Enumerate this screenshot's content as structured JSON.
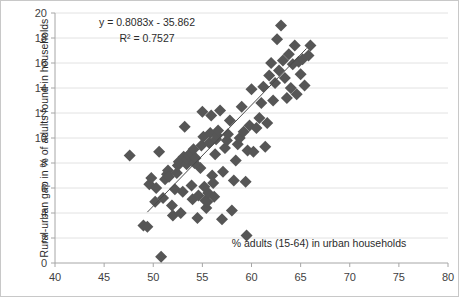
{
  "chart_data": {
    "type": "scatter",
    "title": "",
    "xlabel": "% adults (15-64) in urban households",
    "ylabel": "Rural-urban gap in % of adults found in households",
    "xlim": [
      40,
      80
    ],
    "ylim": [
      0,
      20
    ],
    "xticks": [
      40,
      45,
      50,
      55,
      60,
      65,
      70,
      75,
      80
    ],
    "yticks": [
      0,
      2,
      4,
      6,
      8,
      10,
      12,
      14,
      16,
      18,
      20
    ],
    "grid": "horizontal",
    "legend": "none",
    "annotations": {
      "equation": "y = 0.8083x - 35.862",
      "r_squared": "R² = 0.7527"
    },
    "trendline": {
      "slope": 0.8083,
      "intercept": -35.862,
      "r2": 0.7527,
      "x_start": 49.4,
      "x_end": 65.6
    },
    "marker": {
      "shape": "diamond",
      "color": "#565656",
      "size": 6
    },
    "points": [
      [
        49.0,
        3.0
      ],
      [
        49.4,
        2.9
      ],
      [
        49.6,
        6.3
      ],
      [
        49.8,
        6.8
      ],
      [
        50.2,
        4.9
      ],
      [
        50.3,
        6.0
      ],
      [
        50.6,
        8.9
      ],
      [
        50.8,
        0.5
      ],
      [
        51.0,
        5.2
      ],
      [
        51.2,
        6.7
      ],
      [
        51.4,
        7.1
      ],
      [
        51.5,
        7.4
      ],
      [
        51.6,
        6.9
      ],
      [
        51.9,
        4.6
      ],
      [
        52.0,
        3.8
      ],
      [
        52.2,
        5.9
      ],
      [
        52.4,
        7.2
      ],
      [
        52.5,
        7.8
      ],
      [
        52.6,
        8.1
      ],
      [
        52.8,
        4.0
      ],
      [
        53.0,
        5.7
      ],
      [
        53.1,
        8.5
      ],
      [
        53.2,
        10.9
      ],
      [
        53.4,
        7.9
      ],
      [
        53.5,
        8.3
      ],
      [
        53.6,
        8.6
      ],
      [
        53.8,
        8.8
      ],
      [
        53.9,
        6.2
      ],
      [
        54.0,
        5.1
      ],
      [
        54.1,
        9.1
      ],
      [
        54.2,
        8.0
      ],
      [
        54.3,
        8.4
      ],
      [
        54.5,
        3.6
      ],
      [
        54.6,
        5.4
      ],
      [
        54.8,
        7.6
      ],
      [
        54.9,
        9.4
      ],
      [
        55.0,
        12.1
      ],
      [
        55.1,
        10.1
      ],
      [
        55.2,
        6.1
      ],
      [
        55.3,
        5.0
      ],
      [
        55.4,
        4.4
      ],
      [
        55.5,
        4.9
      ],
      [
        55.6,
        5.6
      ],
      [
        55.7,
        9.6
      ],
      [
        55.8,
        10.4
      ],
      [
        55.9,
        11.8
      ],
      [
        56.0,
        7.0
      ],
      [
        56.1,
        6.4
      ],
      [
        56.2,
        5.3
      ],
      [
        56.3,
        8.7
      ],
      [
        56.4,
        9.9
      ],
      [
        56.5,
        10.2
      ],
      [
        56.6,
        10.6
      ],
      [
        56.8,
        12.2
      ],
      [
        57.0,
        3.5
      ],
      [
        57.1,
        7.3
      ],
      [
        57.3,
        9.2
      ],
      [
        57.5,
        9.8
      ],
      [
        57.6,
        10.3
      ],
      [
        57.8,
        11.4
      ],
      [
        58.0,
        4.2
      ],
      [
        58.2,
        6.6
      ],
      [
        58.4,
        8.2
      ],
      [
        58.6,
        9.5
      ],
      [
        58.8,
        10.0
      ],
      [
        59.0,
        12.5
      ],
      [
        59.2,
        10.5
      ],
      [
        59.4,
        6.5
      ],
      [
        59.6,
        9.0
      ],
      [
        59.8,
        11.0
      ],
      [
        60.0,
        13.9
      ],
      [
        60.2,
        8.9
      ],
      [
        60.5,
        10.8
      ],
      [
        60.8,
        11.6
      ],
      [
        61.0,
        12.8
      ],
      [
        61.2,
        14.1
      ],
      [
        61.4,
        9.3
      ],
      [
        61.6,
        11.2
      ],
      [
        61.8,
        15.0
      ],
      [
        62.0,
        16.0
      ],
      [
        62.2,
        13.0
      ],
      [
        62.4,
        14.4
      ],
      [
        62.6,
        17.9
      ],
      [
        62.8,
        15.4
      ],
      [
        63.0,
        19.0
      ],
      [
        63.2,
        16.2
      ],
      [
        63.4,
        14.8
      ],
      [
        63.6,
        13.2
      ],
      [
        63.8,
        16.7
      ],
      [
        64.0,
        14.0
      ],
      [
        64.2,
        15.9
      ],
      [
        64.4,
        17.4
      ],
      [
        64.6,
        13.5
      ],
      [
        64.8,
        16.1
      ],
      [
        65.0,
        15.1
      ],
      [
        65.2,
        16.3
      ],
      [
        65.4,
        14.2
      ],
      [
        65.8,
        16.6
      ],
      [
        66.0,
        17.4
      ],
      [
        59.5,
        2.2
      ],
      [
        47.6,
        8.6
      ]
    ]
  }
}
